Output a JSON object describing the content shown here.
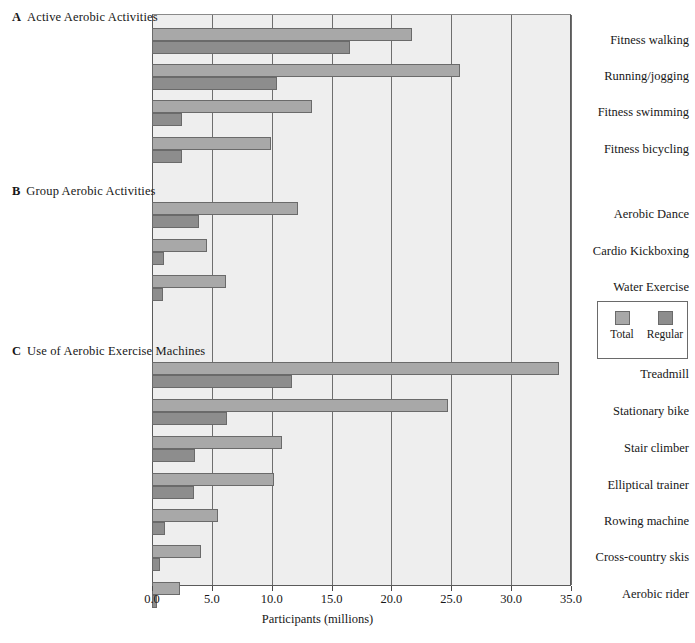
{
  "figure": {
    "axis_title": "Participants (millions)",
    "background": "#eeeeee",
    "colors": {
      "total": "#a8a8a8",
      "regular": "#8d8d8d",
      "gridline": "#6e6e6e",
      "axis": "#4a4a4a"
    }
  },
  "legend": {
    "items": [
      {
        "label": "Total",
        "color": "#a8a8a8",
        "icon": "legend-swatch-total"
      },
      {
        "label": "Regular",
        "color": "#8d8d8d",
        "icon": "legend-swatch-regular"
      }
    ]
  },
  "panels": [
    {
      "letter": "A",
      "title": "Active Aerobic Activities"
    },
    {
      "letter": "B",
      "title": "Group Aerobic Activities"
    },
    {
      "letter": "C",
      "title": "Use of Aerobic Exercise Machines"
    }
  ],
  "chart_data": {
    "type": "bar",
    "orientation": "horizontal",
    "title": "",
    "xlabel": "Participants (millions)",
    "ylabel": "",
    "xlim": [
      0.0,
      35.0
    ],
    "xticks": [
      "0.0",
      "5.0",
      "10.0",
      "15.0",
      "20.0",
      "25.0",
      "30.0",
      "35.0"
    ],
    "xtick_values": [
      0,
      5,
      10,
      15,
      20,
      25,
      30,
      35
    ],
    "grid": "vertical",
    "legend_position": "right-middle",
    "series": [
      {
        "name": "Total",
        "color": "#a8a8a8"
      },
      {
        "name": "Regular",
        "color": "#8d8d8d"
      }
    ],
    "panels": [
      {
        "letter": "A",
        "title": "Active Aerobic Activities",
        "categories": [
          "Fitness walking",
          "Running/jogging",
          "Fitness swimming",
          "Fitness bicycling"
        ],
        "values": {
          "Total": [
            21.7,
            25.7,
            13.4,
            9.9
          ],
          "Regular": [
            16.5,
            10.4,
            2.5,
            2.5
          ]
        }
      },
      {
        "letter": "B",
        "title": "Group Aerobic Activities",
        "categories": [
          "Aerobic Dance",
          "Cardio Kickboxing",
          "Water Exercise"
        ],
        "values": {
          "Total": [
            12.2,
            4.6,
            6.2
          ],
          "Regular": [
            3.9,
            1.0,
            0.9
          ]
        }
      },
      {
        "letter": "C",
        "title": "Use of Aerobic Exercise Machines",
        "categories": [
          "Treadmill",
          "Stationary bike",
          "Stair climber",
          "Elliptical trainer",
          "Rowing machine",
          "Cross-country skis",
          "Aerobic rider"
        ],
        "values": {
          "Total": [
            34.0,
            24.7,
            10.9,
            10.2,
            5.5,
            4.1,
            2.3
          ],
          "Regular": [
            11.7,
            6.3,
            3.6,
            3.5,
            1.1,
            0.7,
            0.4
          ]
        }
      }
    ]
  },
  "layout": {
    "panel_head_tops": [
      10,
      184,
      344
    ],
    "group_tops": [
      28,
      64,
      100,
      137,
      202,
      239,
      275,
      362,
      399,
      436,
      473,
      509,
      545,
      582
    ]
  }
}
